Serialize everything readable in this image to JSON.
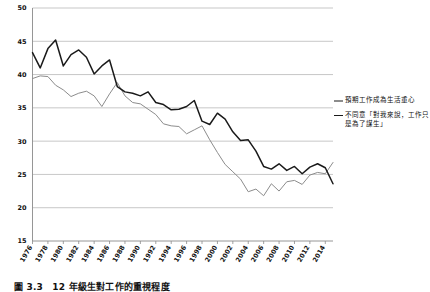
{
  "chart_data": {
    "type": "line",
    "title": "",
    "xlabel": "",
    "ylabel": "",
    "ylim": [
      15,
      50
    ],
    "xlim": [
      1976,
      2015
    ],
    "yticks": [
      15,
      20,
      25,
      30,
      35,
      40,
      45,
      50
    ],
    "grid": true,
    "legend_position": "right",
    "x": [
      1976,
      1977,
      1978,
      1979,
      1980,
      1981,
      1982,
      1983,
      1984,
      1985,
      1986,
      1987,
      1988,
      1989,
      1990,
      1991,
      1992,
      1993,
      1994,
      1995,
      1996,
      1997,
      1998,
      1999,
      2000,
      2001,
      2002,
      2003,
      2004,
      2005,
      2006,
      2007,
      2008,
      2009,
      2010,
      2011,
      2012,
      2013,
      2014,
      2015
    ],
    "tick_labels": [
      "1976",
      "1978",
      "1980",
      "1982",
      "1984",
      "1986",
      "1988",
      "1990",
      "1992",
      "1994",
      "1996",
      "1998",
      "2000",
      "2002",
      "2004",
      "2006",
      "2008",
      "2010",
      "2012",
      "2014"
    ],
    "series": [
      {
        "name": "預期工作成為生活重心",
        "color": "#8c8c8c",
        "values": [
          39.4,
          39.8,
          39.7,
          38.4,
          37.7,
          36.7,
          37.2,
          37.5,
          36.8,
          35.2,
          37.1,
          38.8,
          36.8,
          35.8,
          35.6,
          34.8,
          34.0,
          32.6,
          32.3,
          32.2,
          31.1,
          31.7,
          32.3,
          30.2,
          28.3,
          26.5,
          25.4,
          24.3,
          22.4,
          22.8,
          21.8,
          23.6,
          22.5,
          23.9,
          24.1,
          23.5,
          24.9,
          25.3,
          25.1,
          26.8
        ]
      },
      {
        "name": "不同意「對我來說，工作只是為了謀生」",
        "color": "#1a1a1a",
        "values": [
          43.3,
          41.0,
          43.9,
          45.2,
          41.3,
          43.0,
          43.7,
          42.6,
          40.1,
          41.3,
          42.2,
          38.2,
          37.4,
          37.2,
          36.8,
          37.4,
          35.8,
          35.5,
          34.7,
          34.8,
          35.2,
          36.1,
          33.0,
          32.5,
          34.2,
          33.3,
          31.4,
          30.1,
          30.2,
          28.5,
          26.2,
          25.8,
          26.6,
          25.6,
          26.2,
          25.1,
          26.1,
          26.6,
          26.0,
          23.6
        ]
      }
    ]
  },
  "legend": {
    "entries": [
      {
        "label": "預期工作成為生活重心"
      },
      {
        "label": "不同意「對我來說，工作只是為了謀生」"
      }
    ]
  },
  "caption": {
    "text": "圖 3.3　12 年級生對工作的重視程度"
  }
}
